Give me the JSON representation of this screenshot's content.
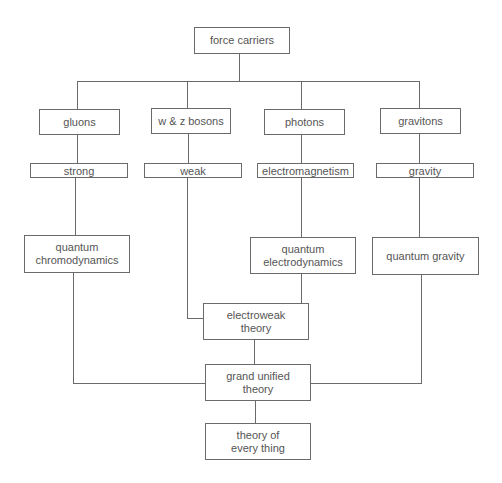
{
  "diagram": {
    "title": "force carriers",
    "nodes": {
      "root": "force carriers",
      "gluons": "gluons",
      "wz": "w & z bosons",
      "photons": "photons",
      "gravitons": "gravitons",
      "strong": "strong",
      "weak": "weak",
      "em": "electromagnetism",
      "gravity": "gravity",
      "qcd": "quantum\nchromodynamics",
      "qed": "quantum\nelectrodynamics",
      "qg": "quantum gravity",
      "ew": "electroweak\ntheory",
      "gut": "grand unified\ntheory",
      "toe": "theory of\nevery thing"
    },
    "edges": [
      [
        "force carriers",
        "gluons"
      ],
      [
        "force carriers",
        "w & z bosons"
      ],
      [
        "force carriers",
        "photons"
      ],
      [
        "force carriers",
        "gravitons"
      ],
      [
        "gluons",
        "strong"
      ],
      [
        "w & z bosons",
        "weak"
      ],
      [
        "photons",
        "electromagnetism"
      ],
      [
        "gravitons",
        "gravity"
      ],
      [
        "strong",
        "quantum chromodynamics"
      ],
      [
        "electromagnetism",
        "quantum electrodynamics"
      ],
      [
        "gravity",
        "quantum gravity"
      ],
      [
        "weak",
        "electroweak theory"
      ],
      [
        "quantum electrodynamics",
        "electroweak theory"
      ],
      [
        "electroweak theory",
        "grand unified theory"
      ],
      [
        "quantum chromodynamics",
        "grand unified theory"
      ],
      [
        "quantum gravity",
        "grand unified theory"
      ],
      [
        "grand unified theory",
        "theory of every thing"
      ]
    ],
    "colors": {
      "line": "#6a6a6a",
      "text": "#555555",
      "background": "#ffffff"
    }
  }
}
